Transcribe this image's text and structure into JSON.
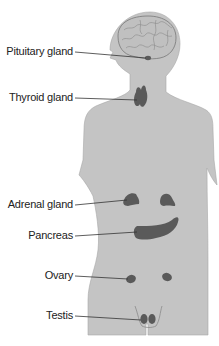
{
  "diagram": {
    "type": "endocrine-system-anatomy",
    "colors": {
      "body": "#c4c4c4",
      "body_outline": "#9a9a9a",
      "gland": "#5a5a5a",
      "brain_lines": "#8a8a8a",
      "leader_line": "#333333",
      "label_text": "#222222"
    },
    "labels": [
      {
        "id": "pituitary",
        "text": "Pituitary gland"
      },
      {
        "id": "thyroid",
        "text": "Thyroid gland"
      },
      {
        "id": "adrenal",
        "text": "Adrenal gland"
      },
      {
        "id": "pancreas",
        "text": "Pancreas"
      },
      {
        "id": "ovary",
        "text": "Ovary"
      },
      {
        "id": "testis",
        "text": "Testis"
      }
    ]
  }
}
